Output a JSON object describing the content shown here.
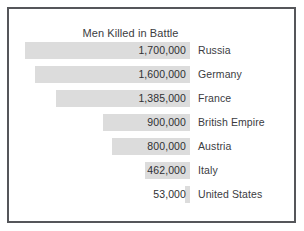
{
  "chart_data": {
    "type": "bar",
    "orientation": "horizontal",
    "title": "Men Killed in Battle",
    "xlabel": "",
    "ylabel": "",
    "grid": false,
    "legend": null,
    "axis_visible": false,
    "value_labels_inside_bars": true,
    "bars_right_aligned": true,
    "xlim": [
      0,
      1700000
    ],
    "categories": [
      "Russia",
      "Germany",
      "France",
      "British Empire",
      "Austria",
      "Italy",
      "United States"
    ],
    "values": [
      1700000,
      1600000,
      1385000,
      900000,
      800000,
      462000,
      53000
    ],
    "value_labels": [
      "1,700,000",
      "1,600,000",
      "1,385,000",
      "900,000",
      "800,000",
      "462,000",
      "53,000"
    ],
    "rows": [
      {
        "label": "Russia",
        "value": 1700000,
        "value_label": "1,700,000",
        "bar_pct": 100.0
      },
      {
        "label": "Germany",
        "value": 1600000,
        "value_label": "1,600,000",
        "bar_pct": 94.1
      },
      {
        "label": "France",
        "value": 1385000,
        "value_label": "1,385,000",
        "bar_pct": 81.5
      },
      {
        "label": "British Empire",
        "value": 900000,
        "value_label": "900,000",
        "bar_pct": 52.9
      },
      {
        "label": "Austria",
        "value": 800000,
        "value_label": "800,000",
        "bar_pct": 47.1
      },
      {
        "label": "Italy",
        "value": 462000,
        "value_label": "462,000",
        "bar_pct": 27.2
      },
      {
        "label": "United States",
        "value": 53000,
        "value_label": "53,000",
        "bar_pct": 3.1
      }
    ],
    "colors": {
      "bar_fill": "#dcdcdc",
      "frame_border": "#55565a",
      "background": "#ffffff",
      "value_text": "#2f3033",
      "label_text": "#3b3c3f",
      "title_text": "#3b3c3f"
    }
  }
}
